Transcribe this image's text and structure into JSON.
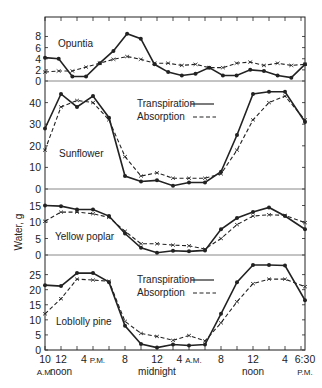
{
  "chart_data": {
    "type": "line",
    "title": "",
    "ylabel": "Water, g",
    "xlabel": "",
    "x_tick_labels": [
      {
        "label": "10",
        "sub": "A.M.",
        "hour": 0
      },
      {
        "label": "12",
        "sub": "noon",
        "hour": 2
      },
      {
        "label": "4 P.M.",
        "sub": "",
        "hour": 6
      },
      {
        "label": "8",
        "sub": "",
        "hour": 10
      },
      {
        "label": "12",
        "sub": "midnight",
        "hour": 14
      },
      {
        "label": "4 A.M.",
        "sub": "",
        "hour": 18
      },
      {
        "label": "8",
        "sub": "",
        "hour": 22
      },
      {
        "label": "12",
        "sub": "noon",
        "hour": 26
      },
      {
        "label": "4",
        "sub": "",
        "hour": 30
      },
      {
        "label": "6:30",
        "sub": "P.M.",
        "hour": 32.5
      }
    ],
    "x_hours": [
      0,
      2,
      4,
      6,
      8,
      10,
      12,
      14,
      16,
      18,
      20,
      22,
      24,
      26,
      28,
      30,
      32.5
    ],
    "legend": [
      {
        "name": "Transpiration",
        "style": "solid",
        "marker": "dot"
      },
      {
        "name": "Absorption",
        "style": "dashed",
        "marker": "x"
      }
    ],
    "panels": [
      {
        "name": "Opuntia",
        "yticks": [
          0,
          2,
          4,
          6,
          8
        ],
        "ylim": [
          0,
          11.5
        ],
        "series": [
          {
            "name": "Transpiration",
            "values": [
              4.2,
              4.0,
              0.8,
              0.8,
              3.2,
              5.4,
              8.5,
              7.6,
              3.0,
              1.6,
              1.0,
              1.3,
              2.4,
              1.0,
              1.0,
              2.0,
              1.8,
              1.0,
              0.6,
              3.0
            ]
          },
          {
            "name": "Absorption",
            "values": [
              1.6,
              1.8,
              1.8,
              2.5,
              3.2,
              3.9,
              4.4,
              3.9,
              3.2,
              3.2,
              2.8,
              3.0,
              2.4,
              2.4,
              3.2,
              3.4,
              2.8,
              3.2,
              2.8,
              3.0
            ]
          }
        ]
      },
      {
        "name": "Sunflower",
        "yticks": [
          0,
          10,
          20,
          30,
          40
        ],
        "ylim": [
          0,
          50
        ],
        "show_legend": true,
        "series": [
          {
            "name": "Transpiration",
            "values": [
              28,
              44,
              38,
              43,
              33,
              6,
              3.5,
              4,
              1.5,
              3,
              3,
              8,
              25,
              44,
              45,
              45,
              31
            ]
          },
          {
            "name": "Absorption",
            "values": [
              18,
              38,
              41,
              40,
              32,
              15,
              6,
              7.5,
              5,
              5,
              5,
              7,
              18,
              32,
              40,
              43,
              32
            ]
          }
        ]
      },
      {
        "name": "Yellow poplar",
        "yticks": [
          0,
          5,
          10,
          15
        ],
        "ylim": [
          0,
          20
        ],
        "series": [
          {
            "name": "Transpiration",
            "values": [
              15,
              14.8,
              13.8,
              13.8,
              11.8,
              6.5,
              2.2,
              0.7,
              1.3,
              1.1,
              1.4,
              7.8,
              11.2,
              13,
              14.4,
              11.8,
              7.8
            ]
          },
          {
            "name": "Absorption",
            "values": [
              10.2,
              13,
              13,
              12.5,
              11.4,
              7.2,
              3.4,
              3.4,
              3,
              2.8,
              1.8,
              5,
              9.2,
              11.8,
              12.2,
              12,
              9.8
            ]
          }
        ]
      },
      {
        "name": "Loblolly pine",
        "yticks": [
          0,
          5,
          10,
          15,
          20,
          25
        ],
        "ylim": [
          0,
          31.5
        ],
        "show_legend": true,
        "series": [
          {
            "name": "Transpiration",
            "values": [
              21.5,
              21.2,
              25.5,
              25.5,
              22.5,
              8,
              2,
              0.8,
              1.8,
              1.5,
              1.8,
              12,
              22.5,
              28.2,
              28.2,
              28,
              16.5
            ]
          },
          {
            "name": "Absorption",
            "values": [
              12,
              17,
              23.5,
              23.2,
              22.8,
              9.5,
              5.5,
              4.5,
              3.2,
              4.8,
              3,
              9,
              16,
              22,
              23.5,
              23.5,
              21
            ]
          }
        ]
      }
    ]
  },
  "ui": {
    "y_axis_label": "Water, g",
    "legend_transpiration": "Transpiration",
    "legend_absorption": "Absorption",
    "caption": "Fig. 1 Periodic variation in absorption and transpiration..."
  }
}
